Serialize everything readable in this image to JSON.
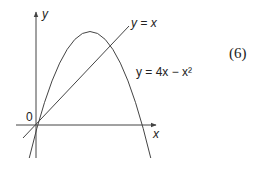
{
  "diagram": {
    "equation_number": "(6)",
    "axes": {
      "x_label": "x",
      "y_label": "y",
      "origin_label": "0"
    },
    "curves": [
      {
        "name": "line",
        "label": "y = x",
        "equation": "y = x"
      },
      {
        "name": "parabola",
        "label": "y = 4x − x²",
        "equation": "y = 4x - x^2"
      }
    ],
    "colors": {
      "stroke": "#444444",
      "text": "#222222",
      "background": "#ffffff"
    }
  }
}
